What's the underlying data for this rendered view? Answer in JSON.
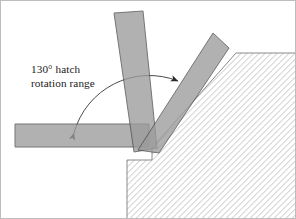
{
  "figure": {
    "canvas": {
      "width": 296,
      "height": 219,
      "background": "#ffffff"
    },
    "border": {
      "visible": true,
      "color": "#b8b8b8",
      "width": 1
    }
  },
  "annotation": {
    "line1": "130° hatch",
    "line2": "rotation range",
    "angle_value": "130°",
    "text_color": "#1a1a1a",
    "font_size_px": 11.2,
    "position": {
      "x": 31,
      "y": 72
    }
  },
  "workpiece": {
    "name": "hatched-workpiece",
    "hatch_angle_deg": 45,
    "hatch_color": "#c9c9c9",
    "hatch_spacing_px": 3,
    "fill": "#ffffff",
    "outline_color": "#7a7a7a",
    "outline_width": 1,
    "chamfer_top_point": {
      "x": 236,
      "y": 53
    },
    "notch_corner": {
      "x": 127,
      "y": 160
    }
  },
  "bars": [
    {
      "name": "horizontal-bar",
      "label": "hatch bar at 0 degrees",
      "angle_deg": 0,
      "fill": "#9c9c9c",
      "opacity": 0.78,
      "outline": "#555555",
      "length_px": 132,
      "width_px": 22
    },
    {
      "name": "vertical-bar",
      "label": "hatch bar near vertical",
      "angle_deg": 98,
      "fill": "#9c9c9c",
      "opacity": 0.78,
      "outline": "#555555",
      "length_px": 138,
      "width_px": 22
    },
    {
      "name": "diagonal-bar",
      "label": "hatch bar along chamfer",
      "angle_deg": 130,
      "fill": "#9c9c9c",
      "opacity": 0.78,
      "outline": "#555555",
      "length_px": 130,
      "width_px": 22
    }
  ],
  "pivot": {
    "name": "bar-pivot-point",
    "x": 145,
    "y": 147
  },
  "range_arc": {
    "name": "rotation-range-arc",
    "sweep_deg": 130,
    "stroke": "#4a4a4a",
    "stroke_width": 1,
    "radius_px": 76,
    "start_arrow": {
      "x": 73,
      "y": 138,
      "direction": "down"
    },
    "end_arrow": {
      "x": 182,
      "y": 86,
      "direction": "down-right"
    }
  }
}
